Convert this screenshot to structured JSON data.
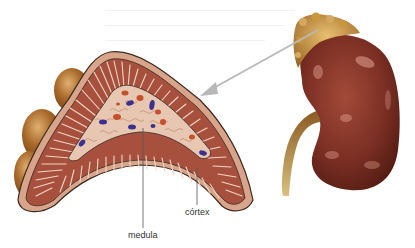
{
  "figure": {
    "labels": {
      "cortex": "córtex",
      "medulla": "medula"
    },
    "colors": {
      "cortex_stripe": "#a8503e",
      "cortex_stripe_light": "#f2d6c4",
      "capsule": "#d9a58a",
      "outline": "#3a2a22",
      "medulla_fill": "#e7c6b2",
      "cell_blue": "#3b2f8f",
      "cell_red": "#c4502c",
      "fat_bulge": "#a86a2a",
      "kidney": "#7a2e22",
      "kidney_highlight": "#d99a88",
      "adrenal_cap": "#c89040",
      "ureter": "#b89040",
      "arrow": "#b8b8b8",
      "leader_line": "#555555"
    }
  }
}
